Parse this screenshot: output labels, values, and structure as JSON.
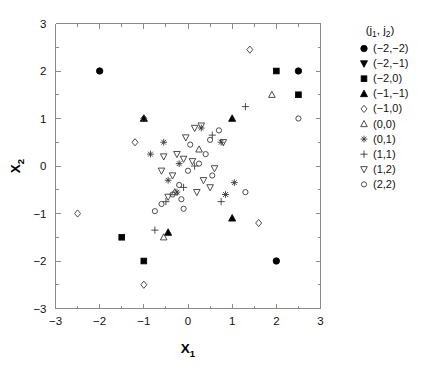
{
  "chart_data": {
    "type": "scatter",
    "title": "",
    "xlabel": "X_1",
    "xlabel_base": "X",
    "xlabel_sub": "1",
    "ylabel": "X_2",
    "ylabel_base": "X",
    "ylabel_sub": "2",
    "xlim": [
      -3,
      3
    ],
    "ylim": [
      -3,
      3
    ],
    "xticks": [
      -3,
      -2,
      -1,
      0,
      1,
      2,
      3
    ],
    "xticklabels": [
      "-3",
      "-2",
      "-1",
      "0",
      "1",
      "2",
      "3"
    ],
    "yticks": [
      -3,
      -2,
      -1,
      0,
      1,
      2,
      3
    ],
    "yticklabels": [
      "-3",
      "-2",
      "-1",
      "0",
      "1",
      "2",
      "3"
    ],
    "minor_ticks": true,
    "grid": false,
    "legend_position": "right-outside",
    "legend_title": "(j_1, j_2)",
    "legend_title_base_open": "(",
    "legend_title_j1": "j",
    "legend_title_sub1": "1",
    "legend_title_comma": ", ",
    "legend_title_j2": "j",
    "legend_title_sub2": "2",
    "legend_title_close": ")",
    "series": [
      {
        "name": "(-2,-2)",
        "label": "(−2,−2)",
        "marker": "filled-circle",
        "points": [
          [
            -2.0,
            2.0
          ],
          [
            2.5,
            2.0
          ],
          [
            2.0,
            -2.0
          ]
        ]
      },
      {
        "name": "(-2,-1)",
        "label": "(−2,−1)",
        "marker": "filled-triangle-down",
        "points": []
      },
      {
        "name": "(-2,0)",
        "label": "(−2,0)",
        "marker": "filled-square",
        "points": [
          [
            2.0,
            2.0
          ],
          [
            2.5,
            1.5
          ],
          [
            -1.5,
            -1.5
          ],
          [
            -1.0,
            -2.0
          ]
        ]
      },
      {
        "name": "(-1,-1)",
        "label": "(−1,−1)",
        "marker": "filled-triangle-up",
        "points": [
          [
            -1.0,
            1.0
          ],
          [
            1.0,
            1.0
          ],
          [
            1.0,
            -1.1
          ],
          [
            -0.45,
            -1.4
          ]
        ]
      },
      {
        "name": "(-1,0)",
        "label": "(−1,0)",
        "marker": "open-diamond",
        "points": [
          [
            -1.0,
            1.0
          ],
          [
            1.4,
            2.45
          ],
          [
            -1.2,
            0.5
          ],
          [
            -2.5,
            -1.0
          ],
          [
            1.6,
            -1.2
          ],
          [
            -1.0,
            -2.5
          ]
        ]
      },
      {
        "name": "(0,0)",
        "label": "(0,0)",
        "marker": "open-triangle-up",
        "points": [
          [
            1.9,
            1.5
          ],
          [
            0.25,
            0.35
          ],
          [
            -0.3,
            -0.55
          ],
          [
            -0.55,
            -1.5
          ]
        ]
      },
      {
        "name": "(0,1)",
        "label": "(0,1)",
        "marker": "asterisk",
        "points": [
          [
            -0.55,
            0.5
          ],
          [
            -0.85,
            0.25
          ],
          [
            0.3,
            0.8
          ],
          [
            0.75,
            0.5
          ],
          [
            -0.2,
            0.05
          ],
          [
            -0.45,
            -0.3
          ],
          [
            -0.25,
            -0.55
          ],
          [
            1.05,
            -0.35
          ],
          [
            0.85,
            -0.6
          ]
        ]
      },
      {
        "name": "(1,1)",
        "label": "(1,1)",
        "marker": "plus",
        "points": [
          [
            1.3,
            1.25
          ],
          [
            0.55,
            0.65
          ],
          [
            0.15,
            0.0
          ],
          [
            -0.1,
            -0.45
          ],
          [
            -0.5,
            -0.75
          ],
          [
            -0.75,
            -1.35
          ],
          [
            0.75,
            -0.75
          ]
        ]
      },
      {
        "name": "(1,2)",
        "label": "(1,2)",
        "marker": "open-triangle-down",
        "points": [
          [
            0.15,
            0.8
          ],
          [
            0.3,
            0.85
          ],
          [
            0.8,
            0.5
          ],
          [
            -0.05,
            0.6
          ],
          [
            -0.1,
            0.15
          ],
          [
            0.1,
            0.1
          ],
          [
            0.6,
            -0.05
          ],
          [
            -0.35,
            -0.2
          ],
          [
            0.35,
            -0.3
          ],
          [
            -0.25,
            0.25
          ],
          [
            -0.55,
            0.2
          ],
          [
            -0.45,
            -0.65
          ],
          [
            0.2,
            -0.55
          ],
          [
            0.5,
            -0.45
          ],
          [
            -0.6,
            -0.1
          ]
        ]
      },
      {
        "name": "(2,2)",
        "label": "(2,2)",
        "marker": "open-circle",
        "points": [
          [
            2.5,
            1.0
          ],
          [
            0.7,
            0.75
          ],
          [
            0.5,
            0.55
          ],
          [
            0.4,
            0.25
          ],
          [
            0.25,
            0.05
          ],
          [
            0.0,
            -0.1
          ],
          [
            -0.2,
            -0.4
          ],
          [
            -0.35,
            -0.6
          ],
          [
            -0.6,
            -0.8
          ],
          [
            -0.75,
            -0.95
          ],
          [
            0.05,
            0.45
          ],
          [
            -0.15,
            -0.7
          ],
          [
            1.3,
            -0.55
          ],
          [
            0.55,
            -0.2
          ],
          [
            -0.1,
            -0.9
          ]
        ]
      }
    ]
  }
}
